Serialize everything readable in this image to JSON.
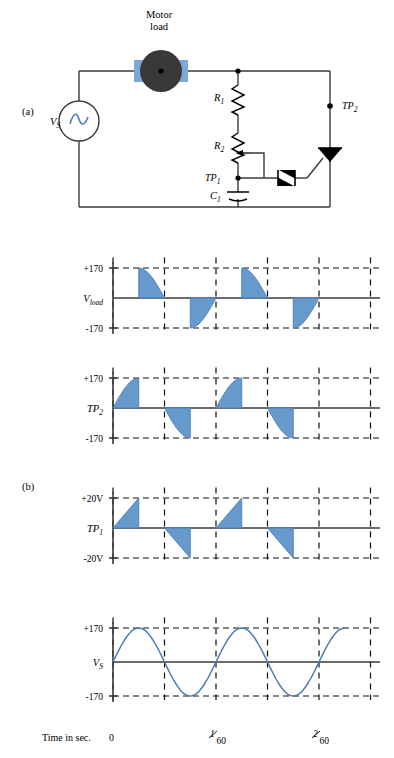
{
  "figure": {
    "panel_a_label": "(a)",
    "panel_b_label": "(b)",
    "accent_blue": "#6699cc",
    "stroke_blue": "#4a7fb5",
    "wire_color": "#3a3a3a",
    "motor_body_color": "#3b3838",
    "motor_terminal_color": "#7da7d9"
  },
  "circuit": {
    "motor_label_line1": "Motor",
    "motor_label_line2": "load",
    "source_label": "V",
    "source_sub": "S",
    "r1_label": "R",
    "r1_sub": "1",
    "r2_label": "R",
    "r2_sub": "2",
    "c1_label": "C",
    "c1_sub": "1",
    "tp1_label": "TP",
    "tp1_sub": "1",
    "tp2_label": "TP",
    "tp2_sub": "2",
    "components": [
      {
        "name": "ac-source",
        "type": "ac-voltage-source"
      },
      {
        "name": "motor-load",
        "type": "motor"
      },
      {
        "name": "r1",
        "type": "resistor"
      },
      {
        "name": "r2",
        "type": "potentiometer"
      },
      {
        "name": "c1",
        "type": "capacitor"
      },
      {
        "name": "diac",
        "type": "diac"
      },
      {
        "name": "triac",
        "type": "triac"
      }
    ]
  },
  "time_axis": {
    "caption": "Time in sec.",
    "ticks": [
      {
        "label": "0",
        "num": "",
        "den": "",
        "x_cycles": 0
      },
      {
        "label": "",
        "num": "1",
        "den": "60",
        "x_cycles": 1
      },
      {
        "label": "",
        "num": "2",
        "den": "60",
        "x_cycles": 2
      }
    ]
  },
  "chart_data": [
    {
      "type": "area",
      "name": "v-load",
      "title": "V_load",
      "y_label_main": "V",
      "y_label_sub": "load",
      "ylim": [
        -170,
        170
      ],
      "ytick_labels": [
        "+170",
        "-170"
      ],
      "ylabel": "",
      "xlabel": "",
      "grid": true,
      "cycles": 2.25,
      "amplitude": 170,
      "waveform": "phase-controlled-sine",
      "firing_angle_deg": 90,
      "description": "Triac load voltage: conduction begins at 90 degrees of each half cycle and follows the sine down to the zero crossing."
    },
    {
      "type": "area",
      "name": "tp2",
      "title": "TP2",
      "y_label_main": "TP",
      "y_label_sub": "2",
      "ylim": [
        -170,
        170
      ],
      "ytick_labels": [
        "+170",
        "-170"
      ],
      "ylabel": "",
      "xlabel": "",
      "grid": true,
      "cycles": 2.25,
      "amplitude": 170,
      "waveform": "blocking-sine",
      "firing_angle_deg": 90,
      "description": "Voltage across the triac: follows the sine from the zero crossing up to the firing point, then collapses to zero."
    },
    {
      "type": "area",
      "name": "tp1",
      "title": "TP1",
      "y_label_main": "TP",
      "y_label_sub": "1",
      "ylim": [
        -20,
        20
      ],
      "ytick_labels": [
        "+20V",
        "-20V"
      ],
      "ylabel": "",
      "xlabel": "",
      "grid": true,
      "cycles": 2.25,
      "amplitude": 20,
      "waveform": "sawtooth-ramp",
      "firing_angle_deg": 90,
      "description": "Capacitor C1 voltage: linear ramp to plus or minus 20 V, then a vertical discharge when the diac fires."
    },
    {
      "type": "line",
      "name": "vs",
      "title": "VS",
      "y_label_main": "V",
      "y_label_sub": "S",
      "ylim": [
        -170,
        170
      ],
      "ytick_labels": [
        "+170",
        "-170"
      ],
      "ylabel": "",
      "xlabel": "",
      "grid": true,
      "cycles": 2.25,
      "amplitude": 170,
      "waveform": "sine",
      "description": "Source voltage: continuous 60 Hz sine, 170 V peak."
    }
  ]
}
